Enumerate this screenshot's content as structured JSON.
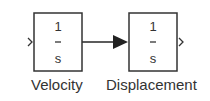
{
  "blocks": [
    {
      "numerator": "1",
      "denominator": "s",
      "label": "Velocity"
    },
    {
      "numerator": "1",
      "denominator": "s",
      "label": "Displacement"
    }
  ]
}
